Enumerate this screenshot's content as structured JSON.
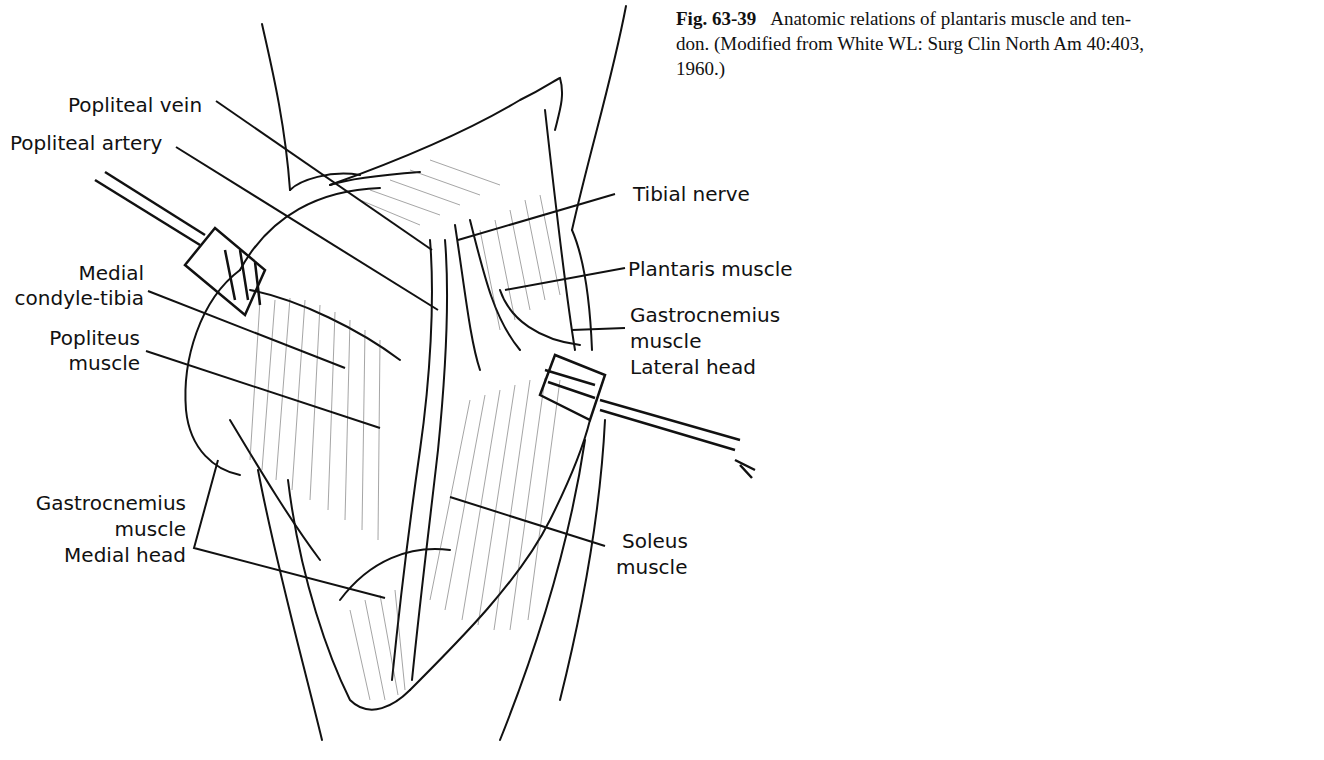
{
  "caption": {
    "figure_number": "Fig. 63-39",
    "text_line1": "Anatomic relations of plantaris muscle and ten-",
    "text_line2": "don. (Modified from White WL: Surg Clin North Am 40:403,",
    "text_line3": "1960.)"
  },
  "labels": {
    "popliteal_vein": "Popliteal vein",
    "popliteal_artery": "Popliteal artery",
    "medial_condyle_1": "Medial",
    "medial_condyle_2": "condyle-tibia",
    "popliteus_1": "Popliteus",
    "popliteus_2": "muscle",
    "gastroc_medial_1": "Gastrocnemius",
    "gastroc_medial_2": "muscle",
    "gastroc_medial_3": "Medial head",
    "tibial_nerve": "Tibial nerve",
    "plantaris": "Plantaris muscle",
    "gastroc_lateral_1": "Gastrocnemius",
    "gastroc_lateral_2": "muscle",
    "gastroc_lateral_3": "Lateral head",
    "soleus_1": "Soleus",
    "soleus_2": "muscle"
  },
  "colors": {
    "ink": "#111111",
    "paper": "#ffffff"
  }
}
